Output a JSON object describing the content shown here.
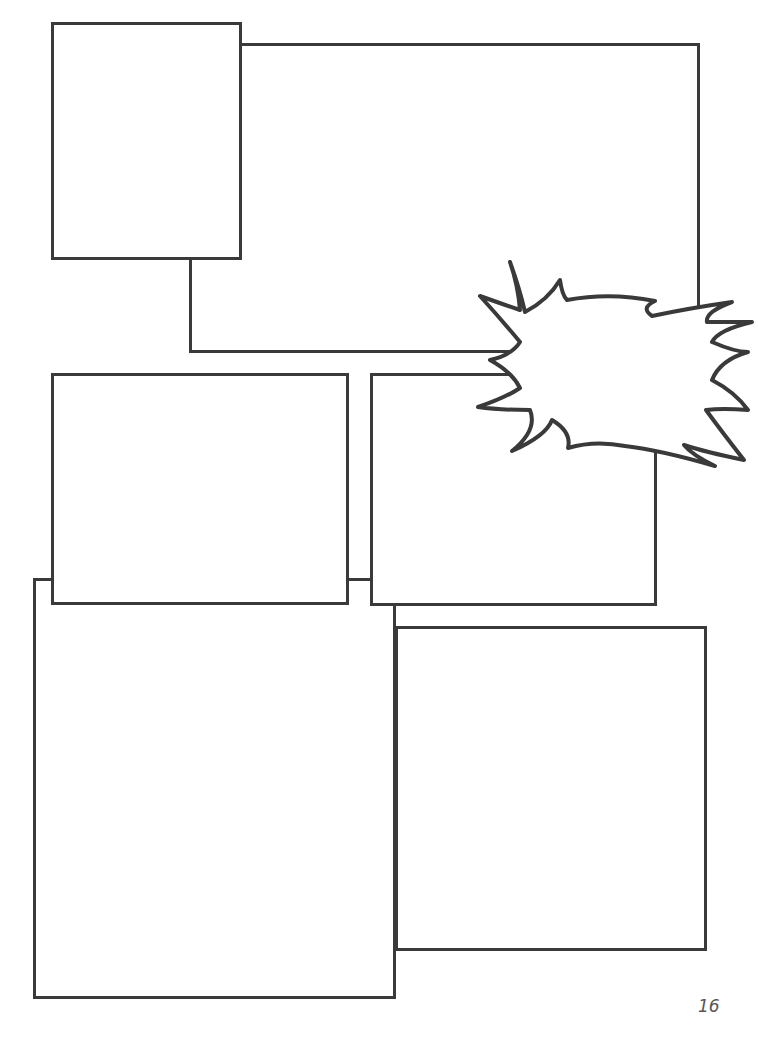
{
  "page": {
    "type": "comic-page-layout-template",
    "background": "#ffffff",
    "border_color": "#3a3a3a",
    "page_number": "16"
  },
  "panels": [
    {
      "id": "panel-1",
      "x": 51,
      "y": 22,
      "w": 191,
      "h": 238,
      "layer": 2
    },
    {
      "id": "panel-2",
      "x": 189,
      "y": 43,
      "w": 511,
      "h": 310,
      "layer": 1
    },
    {
      "id": "panel-3",
      "x": 51,
      "y": 373,
      "w": 298,
      "h": 232,
      "layer": 2
    },
    {
      "id": "panel-4",
      "x": 370,
      "y": 373,
      "w": 287,
      "h": 233,
      "layer": 2
    },
    {
      "id": "panel-5",
      "x": 33,
      "y": 578,
      "w": 363,
      "h": 421,
      "layer": 1
    },
    {
      "id": "panel-6",
      "x": 395,
      "y": 626,
      "w": 312,
      "h": 325,
      "layer": 2
    }
  ],
  "burst_balloon": {
    "shape": "spiky-explosion",
    "bounds": {
      "x": 470,
      "y": 258,
      "w": 282,
      "h": 212
    },
    "text": ""
  }
}
